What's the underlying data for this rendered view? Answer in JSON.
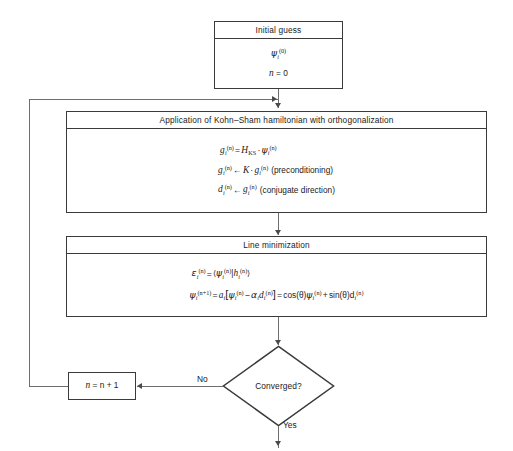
{
  "diagram": {
    "type": "flowchart",
    "accent_color": "#3a3a3a",
    "line_color": "#6e6e6e",
    "background": "#ffffff"
  },
  "nodes": {
    "initial_guess": {
      "header": "Initial guess",
      "line1_psi": "ψ",
      "line1_sub": "i",
      "line1_sup": "(0)",
      "line2": "n = 0",
      "line2_var": "n",
      "line2_rest": " = 0"
    },
    "hamiltonian": {
      "header": "Application of Kohn–Sham hamiltonian with orthogonalization",
      "eq1": {
        "lhs_var": "g",
        "lhs_sub": "i",
        "lhs_sup": "(n)",
        "eq": "=",
        "h_var": "H",
        "h_sub": "KS",
        "dot": "·",
        "psi": "ψ",
        "psi_sub": "i",
        "psi_sup": "(n)"
      },
      "eq2": {
        "lhs_var": "g",
        "lhs_sub": "i",
        "lhs_sup": "(n)",
        "arrow": "←",
        "k_var": "K",
        "dot": "·",
        "rhs_var": "g",
        "rhs_sub": "i",
        "rhs_sup": "(n)",
        "note": "(preconditioning)"
      },
      "eq3": {
        "lhs_var": "d",
        "lhs_sub": "i",
        "lhs_sup": "(n)",
        "arrow": "←",
        "rhs_var": "g",
        "rhs_sub": "i",
        "rhs_sup": "(n)",
        "note": "(conjugate direction)"
      }
    },
    "line_minimization": {
      "header": "Line minimization",
      "eq1": {
        "lhs_var": "ε",
        "lhs_sub": "i",
        "lhs_sup": "(n)",
        "eq": "=",
        "bra_open": "⟨",
        "psi": "ψ",
        "psi_sub": "i",
        "psi_sup": "(n)",
        "bar": "|",
        "h_var": "h",
        "h_sub": "i",
        "h_sup": "(n)",
        "bra_close": "⟩"
      },
      "eq2": {
        "lhs_psi": "ψ",
        "lhs_sub": "i",
        "lhs_sup": "(n+1)",
        "eq": "=",
        "a_var": "a",
        "a_sub": "i",
        "bracket_open": "[",
        "psi": "ψ",
        "psi_sub": "i",
        "psi_sup": "(n)",
        "minus": "−",
        "alpha": "α",
        "alpha_sub": "i",
        "d_var": "d",
        "d_sub": "i",
        "d_sup": "(n)",
        "bracket_close": "]",
        "eq2sign": "=",
        "cos": "cos(θ)",
        "psi2": "ψ",
        "psi2_sub": "i",
        "psi2_sup": "(n)",
        "plus": "+",
        "sin": "sin(θ)",
        "d2_var": "d",
        "d2_sub": "i",
        "d2_sup": "(n)"
      }
    },
    "increment": {
      "var": "n",
      "rest": " = n + 1",
      "full": "n = n + 1"
    },
    "decision": {
      "label": "Converged?",
      "branch_no": "No",
      "branch_yes": "Yes"
    }
  }
}
